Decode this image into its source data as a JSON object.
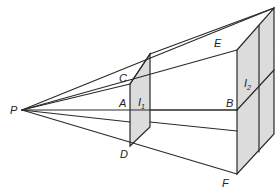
{
  "diagram": {
    "type": "perspective-projection",
    "colors": {
      "stroke": "#2a2a2a",
      "panel_fill": "#dcdcdc",
      "background": "#ffffff"
    },
    "points": {
      "P": {
        "label": "P",
        "x": 22,
        "y": 110
      },
      "A": {
        "label": "A",
        "x": 130,
        "y": 110
      },
      "B": {
        "label": "B",
        "x": 237,
        "y": 110
      },
      "C": {
        "label": "C",
        "x": 130,
        "y": 84
      },
      "D": {
        "label": "D",
        "x": 130,
        "y": 146
      },
      "E": {
        "label": "E",
        "x": 237,
        "y": 50
      },
      "F": {
        "label": "F",
        "x": 237,
        "y": 174
      }
    },
    "panels": [
      {
        "id": "I1",
        "label": "I",
        "subscript": "1"
      },
      {
        "id": "I2",
        "label": "I",
        "subscript": "2"
      }
    ]
  }
}
